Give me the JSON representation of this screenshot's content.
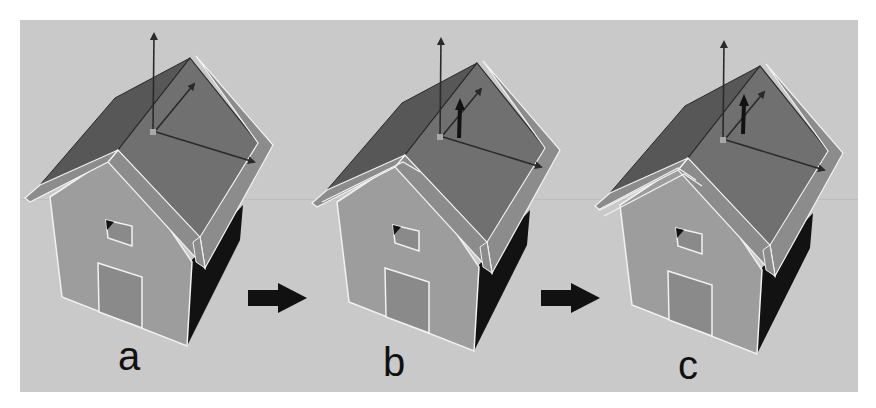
{
  "figure": {
    "panels": [
      {
        "id": "a",
        "label": "a",
        "offset_x": 0,
        "offset_y": 0,
        "trim_layers": 1,
        "extra_arrow": false
      },
      {
        "id": "b",
        "label": "b",
        "offset_x": 287,
        "offset_y": 5,
        "trim_layers": 2,
        "extra_arrow": true
      },
      {
        "id": "c",
        "label": "c",
        "offset_x": 570,
        "offset_y": 8,
        "trim_layers": 3,
        "extra_arrow": true
      }
    ],
    "step_arrows": [
      {
        "name": "arrow-a-to-b",
        "x": 248,
        "y": 283
      },
      {
        "name": "arrow-b-to-c",
        "x": 541,
        "y": 283
      }
    ]
  },
  "colors": {
    "background": "#c9c9c9",
    "roof_right": "#707070",
    "roof_left": "#575757",
    "roof_trim": "#8c8c8c",
    "wall": "#9d9d9d",
    "door": "#8a8a8a",
    "side_wall": "#121212",
    "outline": "#f2f2f2",
    "gizmo": "#2a2a2a"
  },
  "labels": {
    "a": "a",
    "b": "b",
    "c": "c"
  }
}
